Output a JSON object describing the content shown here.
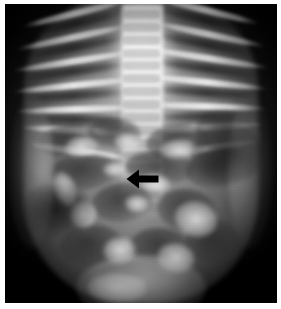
{
  "figure": {
    "kind": "radiograph",
    "modality": "X-ray",
    "view": "anteroposterior",
    "body_region": "chest-and-abdomen",
    "colorspace": "grayscale",
    "width_px": 281,
    "height_px": 309,
    "background_color": "#ffffff",
    "film_color": "#0a0a0a",
    "caption": ""
  },
  "film": {
    "left_px": 5,
    "top_px": 4,
    "width_px": 272,
    "height_px": 299,
    "margin_color": "#ffffff"
  },
  "annotations": [
    {
      "name": "pointer-arrow",
      "shape": "solid-arrow",
      "direction": "left",
      "color": "#000000",
      "x_px": 121,
      "y_px": 165,
      "width_px": 33,
      "height_px": 20,
      "label": ""
    }
  ],
  "anatomy": {
    "spine": {
      "x_pct": 43,
      "width_pct": 15,
      "top_pct": 0,
      "height_pct": 72,
      "tone": "bright"
    },
    "ribs_left_count": 7,
    "ribs_right_count": 7,
    "bowel_gas_loops": 14,
    "diaphragm_visible": true
  },
  "ribs": [
    {
      "side": "right",
      "left_pct": 6,
      "top_pct": 2,
      "width_pct": 40,
      "rotate_deg": -14
    },
    {
      "side": "right",
      "left_pct": 4,
      "top_pct": 10,
      "width_pct": 42,
      "rotate_deg": -12
    },
    {
      "side": "right",
      "left_pct": 3,
      "top_pct": 18,
      "width_pct": 44,
      "rotate_deg": -9
    },
    {
      "side": "right",
      "left_pct": 3,
      "top_pct": 26,
      "width_pct": 45,
      "rotate_deg": -6
    },
    {
      "side": "right",
      "left_pct": 4,
      "top_pct": 34,
      "width_pct": 44,
      "rotate_deg": -2
    },
    {
      "side": "right",
      "left_pct": 6,
      "top_pct": 41,
      "width_pct": 42,
      "rotate_deg": 3
    },
    {
      "side": "right",
      "left_pct": 9,
      "top_pct": 48,
      "width_pct": 38,
      "rotate_deg": 8
    },
    {
      "side": "left",
      "left_pct": 54,
      "top_pct": 1,
      "width_pct": 40,
      "rotate_deg": 14
    },
    {
      "side": "left",
      "left_pct": 54,
      "top_pct": 9,
      "width_pct": 42,
      "rotate_deg": 12
    },
    {
      "side": "left",
      "left_pct": 53,
      "top_pct": 17,
      "width_pct": 44,
      "rotate_deg": 9
    },
    {
      "side": "left",
      "left_pct": 52,
      "top_pct": 25,
      "width_pct": 45,
      "rotate_deg": 6
    },
    {
      "side": "left",
      "left_pct": 52,
      "top_pct": 33,
      "width_pct": 44,
      "rotate_deg": 2
    },
    {
      "side": "left",
      "left_pct": 53,
      "top_pct": 40,
      "width_pct": 42,
      "rotate_deg": -3
    },
    {
      "side": "left",
      "left_pct": 55,
      "top_pct": 47,
      "width_pct": 38,
      "rotate_deg": -8
    }
  ],
  "intercostals": [
    {
      "left_pct": 7,
      "top_pct": 5,
      "width_pct": 38,
      "rotate_deg": -13
    },
    {
      "left_pct": 5,
      "top_pct": 13,
      "width_pct": 40,
      "rotate_deg": -11
    },
    {
      "left_pct": 4,
      "top_pct": 21,
      "width_pct": 42,
      "rotate_deg": -8
    },
    {
      "left_pct": 4,
      "top_pct": 29,
      "width_pct": 42,
      "rotate_deg": -4
    },
    {
      "left_pct": 6,
      "top_pct": 37,
      "width_pct": 40,
      "rotate_deg": 1
    },
    {
      "left_pct": 55,
      "top_pct": 4,
      "width_pct": 38,
      "rotate_deg": 13
    },
    {
      "left_pct": 54,
      "top_pct": 12,
      "width_pct": 40,
      "rotate_deg": 11
    },
    {
      "left_pct": 53,
      "top_pct": 20,
      "width_pct": 42,
      "rotate_deg": 8
    },
    {
      "left_pct": 53,
      "top_pct": 28,
      "width_pct": 42,
      "rotate_deg": 4
    },
    {
      "left_pct": 54,
      "top_pct": 36,
      "width_pct": 40,
      "rotate_deg": -1
    }
  ],
  "bowel_gas": [
    {
      "left_pct": 12,
      "top_pct": 40,
      "width_pct": 22,
      "height_pct": 11,
      "rotate_deg": -8
    },
    {
      "left_pct": 30,
      "top_pct": 38,
      "width_pct": 20,
      "height_pct": 10,
      "rotate_deg": 4
    },
    {
      "left_pct": 52,
      "top_pct": 40,
      "width_pct": 24,
      "height_pct": 12,
      "rotate_deg": -6
    },
    {
      "left_pct": 70,
      "top_pct": 36,
      "width_pct": 24,
      "height_pct": 14,
      "rotate_deg": 10
    },
    {
      "left_pct": 16,
      "top_pct": 50,
      "width_pct": 26,
      "height_pct": 12,
      "rotate_deg": -4
    },
    {
      "left_pct": 44,
      "top_pct": 49,
      "width_pct": 26,
      "height_pct": 11,
      "rotate_deg": 3
    },
    {
      "left_pct": 66,
      "top_pct": 48,
      "width_pct": 26,
      "height_pct": 13,
      "rotate_deg": -9
    },
    {
      "left_pct": 10,
      "top_pct": 62,
      "width_pct": 20,
      "height_pct": 14,
      "rotate_deg": 6
    },
    {
      "left_pct": 32,
      "top_pct": 60,
      "width_pct": 22,
      "height_pct": 13,
      "rotate_deg": -5
    },
    {
      "left_pct": 56,
      "top_pct": 62,
      "width_pct": 22,
      "height_pct": 14,
      "rotate_deg": 8
    },
    {
      "left_pct": 20,
      "top_pct": 74,
      "width_pct": 24,
      "height_pct": 14,
      "rotate_deg": -3
    },
    {
      "left_pct": 46,
      "top_pct": 75,
      "width_pct": 22,
      "height_pct": 13,
      "rotate_deg": 5
    },
    {
      "left_pct": 66,
      "top_pct": 72,
      "width_pct": 20,
      "height_pct": 15,
      "rotate_deg": -7
    },
    {
      "left_pct": 34,
      "top_pct": 86,
      "width_pct": 26,
      "height_pct": 12,
      "rotate_deg": 2
    }
  ],
  "tissue_highlights": [
    {
      "left_pct": 22,
      "top_pct": 44,
      "width_pct": 12,
      "height_pct": 7,
      "rotate_deg": -10
    },
    {
      "left_pct": 40,
      "top_pct": 43,
      "width_pct": 10,
      "height_pct": 6,
      "rotate_deg": 6
    },
    {
      "left_pct": 57,
      "top_pct": 45,
      "width_pct": 14,
      "height_pct": 7,
      "rotate_deg": -4
    },
    {
      "left_pct": 36,
      "top_pct": 53,
      "width_pct": 9,
      "height_pct": 5,
      "rotate_deg": 0
    },
    {
      "left_pct": 50,
      "top_pct": 57,
      "width_pct": 11,
      "height_pct": 6,
      "rotate_deg": 8
    },
    {
      "left_pct": 24,
      "top_pct": 66,
      "width_pct": 10,
      "height_pct": 9,
      "rotate_deg": -14
    },
    {
      "left_pct": 44,
      "top_pct": 64,
      "width_pct": 9,
      "height_pct": 6,
      "rotate_deg": 4
    },
    {
      "left_pct": 62,
      "top_pct": 66,
      "width_pct": 16,
      "height_pct": 12,
      "rotate_deg": 18
    },
    {
      "left_pct": 36,
      "top_pct": 78,
      "width_pct": 12,
      "height_pct": 9,
      "rotate_deg": -6
    },
    {
      "left_pct": 56,
      "top_pct": 80,
      "width_pct": 14,
      "height_pct": 10,
      "rotate_deg": 10
    },
    {
      "left_pct": 30,
      "top_pct": 90,
      "width_pct": 22,
      "height_pct": 10,
      "rotate_deg": 2
    },
    {
      "left_pct": 18,
      "top_pct": 56,
      "width_pct": 8,
      "height_pct": 12,
      "rotate_deg": -20
    }
  ]
}
